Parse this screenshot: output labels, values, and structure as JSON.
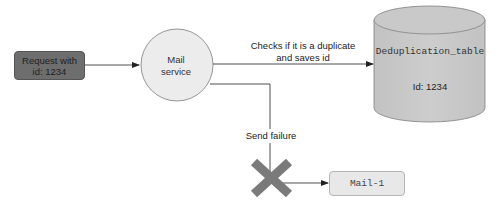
{
  "diagram": {
    "nodes": {
      "request": {
        "label_line1": "Request with",
        "label_line2": "id: 1234",
        "shape": "rounded-rect",
        "fill": "#6e6e6e"
      },
      "mail_service": {
        "label_line1": "Mail",
        "label_line2": "service",
        "shape": "circle",
        "fill": "#ececec"
      },
      "dedup_table": {
        "name": "Deduplication_table",
        "content": "Id: 1234",
        "shape": "cylinder",
        "fill": "#c8c8c8"
      },
      "mail1": {
        "label": "Mail-1",
        "shape": "rounded-rect",
        "fill": "#e8e8e8"
      }
    },
    "edges": {
      "request_to_mail": {
        "label": ""
      },
      "mail_to_table": {
        "label_line1": "Checks if it is a duplicate",
        "label_line2": "and saves id"
      },
      "mail_to_mail1": {
        "label": "Send failure",
        "blocked_marker": "x-cross"
      }
    },
    "colors": {
      "line": "#3a3a3a",
      "cross": "#7a7a7a"
    }
  }
}
